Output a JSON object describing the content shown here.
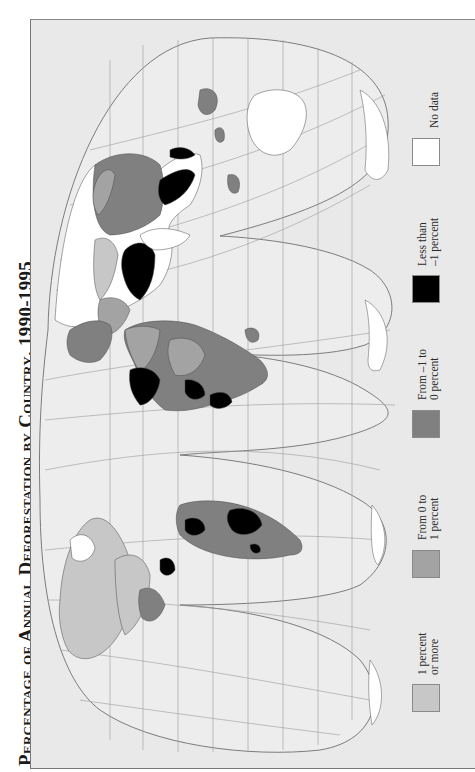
{
  "title": {
    "line": "Percentage of Annual Deforestation by Country, 1990-1995"
  },
  "map": {
    "projection": "interrupted homolosine, rotated 90° counter-clockwise (north at left)",
    "colors": {
      "background": "#e9e9e9",
      "ocean": "#e9e9e9",
      "graticule": "#9a9a9a",
      "outline": "#6f6f6f",
      "gain_1_or_more": "#c7c7c7",
      "gain_0_to_1": "#a3a3a3",
      "loss_0_to_1": "#808080",
      "loss_more_than_1": "#000000",
      "no_data": "#ffffff"
    }
  },
  "legend": {
    "items": [
      {
        "line1": "1 percent",
        "line2": "or more",
        "color": "#c7c7c7"
      },
      {
        "line1": "From 0 to",
        "line2": "1 percent",
        "color": "#a3a3a3"
      },
      {
        "line1": "From –1 to",
        "line2": "0 percent",
        "color": "#808080"
      },
      {
        "line1": "Less than",
        "line2": "–1 percent",
        "color": "#000000"
      },
      {
        "line1": "No data",
        "line2": "",
        "color": "#ffffff"
      }
    ]
  }
}
